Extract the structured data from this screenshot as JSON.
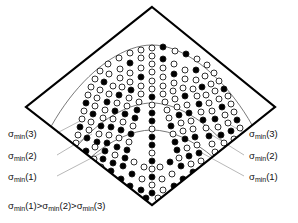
{
  "figure": {
    "background_color": "#ffffff",
    "outline_color": "#000000",
    "arc_color": "#555555",
    "leader_color": "#9a9a9a",
    "circle_stroke": "#1a1a1a",
    "circle_fill_open": "#ffffff",
    "circle_fill_solid": "#000000",
    "diamond": {
      "top": [
        152,
        7
      ],
      "right": [
        275,
        107
      ],
      "bottom": [
        152,
        205
      ],
      "left": [
        26,
        107
      ],
      "stroke_width": 2.2
    },
    "arcs": [
      {
        "name": "sigma-min-3-arc",
        "label": "σmin(3)",
        "apex_y": 45
      },
      {
        "name": "sigma-min-2-arc",
        "label": "σmin(2)",
        "apex_y": 103
      },
      {
        "name": "sigma-min-1-arc",
        "label": "σmin(1)",
        "apex_y": 130
      }
    ]
  },
  "labels_left": [
    {
      "sigma": "σ",
      "sub": "min",
      "arg": "(3)",
      "name": "label-left-sigma-min-3"
    },
    {
      "sigma": "σ",
      "sub": "min",
      "arg": "(2)",
      "name": "label-left-sigma-min-2"
    },
    {
      "sigma": "σ",
      "sub": "min",
      "arg": "(1)",
      "name": "label-left-sigma-min-1"
    }
  ],
  "labels_right": [
    {
      "sigma": "σ",
      "sub": "min",
      "arg": "(3)",
      "name": "label-right-sigma-min-3"
    },
    {
      "sigma": "σ",
      "sub": "min",
      "arg": "(2)",
      "name": "label-right-sigma-min-2"
    },
    {
      "sigma": "σ",
      "sub": "min",
      "arg": "(1)",
      "name": "label-right-sigma-min-1"
    }
  ],
  "caption": {
    "full_text": "σmin(1)>σmin(2)>σmin(3)",
    "sigma": "σ",
    "sub": "min",
    "part1": "(1)>",
    "part2": "(2)>",
    "part3": "(3)"
  },
  "markers": {
    "open_label": "open circle",
    "solid_label": "filled circle",
    "radius": 3.0,
    "stroke_width": 0.9,
    "band_fill_ratio": {
      "outer_band_top": 0.28,
      "middle_band": 0.5,
      "inner_band_bottom": 0.62
    },
    "points": [
      [
        152,
        48,
        0
      ],
      [
        163,
        47,
        1
      ],
      [
        141,
        50,
        0
      ],
      [
        175,
        51,
        0
      ],
      [
        130,
        53,
        0
      ],
      [
        186,
        54,
        1
      ],
      [
        152,
        56,
        0
      ],
      [
        119,
        58,
        0
      ],
      [
        197,
        59,
        0
      ],
      [
        141,
        58,
        0
      ],
      [
        163,
        59,
        1
      ],
      [
        108,
        64,
        0
      ],
      [
        207,
        65,
        0
      ],
      [
        130,
        63,
        1
      ],
      [
        174,
        64,
        0
      ],
      [
        152,
        64,
        0
      ],
      [
        120,
        69,
        0
      ],
      [
        196,
        70,
        1
      ],
      [
        141,
        68,
        0
      ],
      [
        163,
        68,
        0
      ],
      [
        185,
        70,
        0
      ],
      [
        100,
        71,
        0
      ],
      [
        214,
        73,
        0
      ],
      [
        109,
        74,
        0
      ],
      [
        205,
        76,
        0
      ],
      [
        130,
        73,
        0
      ],
      [
        174,
        74,
        1
      ],
      [
        152,
        72,
        0
      ],
      [
        120,
        78,
        0
      ],
      [
        196,
        80,
        0
      ],
      [
        141,
        77,
        1
      ],
      [
        163,
        77,
        0
      ],
      [
        185,
        79,
        0
      ],
      [
        95,
        79,
        0
      ],
      [
        219,
        81,
        0
      ],
      [
        104,
        82,
        1
      ],
      [
        211,
        84,
        0
      ],
      [
        130,
        82,
        0
      ],
      [
        174,
        83,
        0
      ],
      [
        152,
        81,
        0
      ],
      [
        113,
        86,
        0
      ],
      [
        202,
        87,
        1
      ],
      [
        122,
        87,
        0
      ],
      [
        193,
        89,
        0
      ],
      [
        141,
        86,
        0
      ],
      [
        163,
        86,
        0
      ],
      [
        183,
        88,
        0
      ],
      [
        91,
        87,
        0
      ],
      [
        224,
        89,
        1
      ],
      [
        100,
        90,
        0
      ],
      [
        215,
        91,
        0
      ],
      [
        131,
        90,
        1
      ],
      [
        173,
        91,
        0
      ],
      [
        152,
        89,
        0
      ],
      [
        109,
        94,
        0
      ],
      [
        206,
        95,
        0
      ],
      [
        119,
        95,
        1
      ],
      [
        197,
        96,
        0
      ],
      [
        141,
        94,
        0
      ],
      [
        163,
        94,
        0
      ],
      [
        185,
        96,
        1
      ],
      [
        88,
        95,
        0
      ],
      [
        228,
        96,
        0
      ],
      [
        97,
        98,
        0
      ],
      [
        219,
        99,
        0
      ],
      [
        129,
        98,
        0
      ],
      [
        175,
        99,
        0
      ],
      [
        152,
        97,
        1
      ],
      [
        107,
        102,
        1
      ],
      [
        209,
        103,
        0
      ],
      [
        117,
        103,
        0
      ],
      [
        199,
        104,
        1
      ],
      [
        139,
        102,
        0
      ],
      [
        165,
        102,
        0
      ],
      [
        187,
        105,
        0
      ],
      [
        86,
        103,
        1
      ],
      [
        231,
        104,
        0
      ],
      [
        95,
        106,
        0
      ],
      [
        222,
        107,
        1
      ],
      [
        127,
        106,
        0
      ],
      [
        177,
        107,
        0
      ],
      [
        152,
        105,
        0
      ],
      [
        105,
        110,
        0
      ],
      [
        212,
        111,
        0
      ],
      [
        115,
        111,
        1
      ],
      [
        201,
        112,
        0
      ],
      [
        137,
        110,
        1
      ],
      [
        167,
        110,
        0
      ],
      [
        189,
        113,
        1
      ],
      [
        84,
        111,
        0
      ],
      [
        234,
        112,
        0
      ],
      [
        93,
        114,
        1
      ],
      [
        225,
        115,
        0
      ],
      [
        125,
        114,
        1
      ],
      [
        179,
        115,
        1
      ],
      [
        152,
        113,
        1
      ],
      [
        103,
        118,
        0
      ],
      [
        215,
        119,
        1
      ],
      [
        113,
        119,
        0
      ],
      [
        203,
        120,
        1
      ],
      [
        135,
        118,
        1
      ],
      [
        169,
        118,
        0
      ],
      [
        191,
        121,
        0
      ],
      [
        82,
        119,
        0
      ],
      [
        237,
        120,
        1
      ],
      [
        91,
        122,
        0
      ],
      [
        228,
        123,
        0
      ],
      [
        123,
        122,
        0
      ],
      [
        181,
        123,
        0
      ],
      [
        152,
        121,
        1
      ],
      [
        101,
        126,
        1
      ],
      [
        218,
        127,
        0
      ],
      [
        111,
        127,
        1
      ],
      [
        206,
        128,
        0
      ],
      [
        133,
        126,
        0
      ],
      [
        171,
        126,
        1
      ],
      [
        193,
        129,
        0
      ],
      [
        80,
        127,
        1
      ],
      [
        240,
        128,
        0
      ],
      [
        89,
        130,
        0
      ],
      [
        231,
        131,
        1
      ],
      [
        121,
        130,
        1
      ],
      [
        183,
        131,
        0
      ],
      [
        152,
        129,
        0
      ],
      [
        99,
        134,
        0
      ],
      [
        221,
        135,
        1
      ],
      [
        109,
        135,
        0
      ],
      [
        209,
        136,
        1
      ],
      [
        131,
        134,
        1
      ],
      [
        173,
        134,
        0
      ],
      [
        195,
        137,
        1
      ],
      [
        78,
        135,
        0
      ],
      [
        243,
        136,
        0
      ],
      [
        87,
        138,
        1
      ],
      [
        234,
        139,
        0
      ],
      [
        119,
        138,
        0
      ],
      [
        185,
        139,
        1
      ],
      [
        152,
        137,
        1
      ],
      [
        97,
        142,
        1
      ],
      [
        224,
        143,
        0
      ],
      [
        107,
        143,
        1
      ],
      [
        212,
        144,
        0
      ],
      [
        129,
        142,
        0
      ],
      [
        175,
        142,
        1
      ],
      [
        197,
        145,
        0
      ],
      [
        76,
        143,
        0
      ],
      [
        246,
        144,
        1
      ],
      [
        95,
        147,
        0
      ],
      [
        227,
        148,
        1
      ],
      [
        117,
        147,
        1
      ],
      [
        187,
        148,
        0
      ],
      [
        152,
        145,
        1
      ],
      [
        105,
        151,
        1
      ],
      [
        215,
        152,
        0
      ],
      [
        127,
        150,
        1
      ],
      [
        177,
        150,
        1
      ],
      [
        199,
        153,
        1
      ],
      [
        86,
        151,
        1
      ],
      [
        237,
        152,
        0
      ],
      [
        115,
        155,
        0
      ],
      [
        189,
        156,
        1
      ],
      [
        152,
        153,
        0
      ],
      [
        103,
        159,
        1
      ],
      [
        218,
        160,
        1
      ],
      [
        125,
        158,
        1
      ],
      [
        179,
        158,
        0
      ],
      [
        201,
        161,
        0
      ],
      [
        94,
        159,
        0
      ],
      [
        229,
        160,
        1
      ],
      [
        113,
        163,
        1
      ],
      [
        191,
        164,
        0
      ],
      [
        152,
        161,
        1
      ],
      [
        134,
        162,
        0
      ],
      [
        170,
        162,
        1
      ],
      [
        101,
        167,
        0
      ],
      [
        210,
        168,
        1
      ],
      [
        123,
        166,
        1
      ],
      [
        181,
        166,
        1
      ],
      [
        144,
        167,
        0
      ],
      [
        160,
        167,
        0
      ],
      [
        111,
        171,
        1
      ],
      [
        193,
        172,
        1
      ],
      [
        152,
        169,
        0
      ],
      [
        132,
        174,
        1
      ],
      [
        172,
        174,
        0
      ],
      [
        121,
        179,
        1
      ],
      [
        183,
        179,
        1
      ],
      [
        142,
        179,
        0
      ],
      [
        162,
        179,
        0
      ],
      [
        152,
        177,
        1
      ],
      [
        130,
        186,
        1
      ],
      [
        174,
        186,
        1
      ],
      [
        141,
        190,
        1
      ],
      [
        163,
        190,
        0
      ],
      [
        152,
        185,
        0
      ],
      [
        152,
        193,
        1
      ],
      [
        146,
        198,
        1
      ],
      [
        158,
        198,
        0
      ]
    ]
  }
}
